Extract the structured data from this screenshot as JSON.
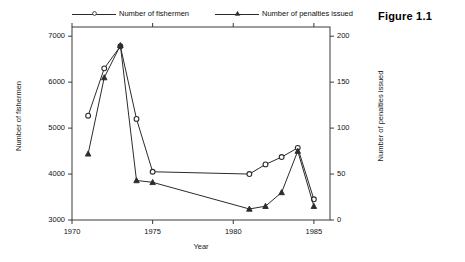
{
  "figure": {
    "title": "Figure 1.1"
  },
  "chart_data": {
    "type": "line",
    "title": "",
    "xlabel": "Year",
    "ylabel": "Number of fishermen",
    "y2label": "Number of penalties issued",
    "x": [
      1971,
      1972,
      1973,
      1974,
      1975,
      1981,
      1982,
      1983,
      1984,
      1985
    ],
    "xlim": [
      1970,
      1986
    ],
    "ylim": [
      3000,
      7200
    ],
    "y2lim": [
      0,
      210
    ],
    "xticks": [
      1970,
      1975,
      1980,
      1985
    ],
    "xticklabels": [
      "1970",
      "1975",
      "1980",
      "1985"
    ],
    "yticks": [
      3000,
      4000,
      5000,
      6000,
      7000
    ],
    "yticklabels": [
      "3000",
      "4000",
      "5000",
      "6000",
      "7000"
    ],
    "y2ticks": [
      0,
      50,
      100,
      150,
      200
    ],
    "y2ticklabels": [
      "0",
      "50",
      "100",
      "150",
      "200"
    ],
    "grid": false,
    "legend_position": "top",
    "series": [
      {
        "name": "Number of fishermen",
        "axis": "left",
        "marker": "circle",
        "color": "#2b2b2b",
        "values": [
          5270,
          6300,
          6780,
          5200,
          4050,
          4000,
          4210,
          4370,
          4570,
          3450
        ]
      },
      {
        "name": "Number of penalties issued",
        "axis": "right",
        "marker": "triangle",
        "color": "#2b2b2b",
        "values": [
          72,
          155,
          190,
          43,
          41,
          12,
          15,
          30,
          75,
          15
        ]
      }
    ]
  },
  "legend": {
    "items": [
      {
        "label": "Number of fishermen",
        "marker": "circle"
      },
      {
        "label": "Number of penalties issued",
        "marker": "triangle"
      }
    ]
  }
}
